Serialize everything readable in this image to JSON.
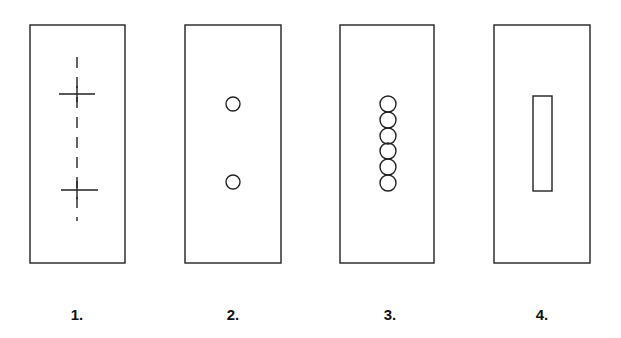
{
  "figure": {
    "stroke_color": "#222222",
    "background": "#ffffff",
    "panels": [
      {
        "label": "1.",
        "frame": {
          "x": 30,
          "y": 25,
          "w": 95,
          "h": 238
        },
        "content": "dashed vertical center line with two cross marks",
        "crosses_y": [
          94,
          189
        ],
        "center_x": 77
      },
      {
        "label": "2.",
        "frame": {
          "x": 185,
          "y": 25,
          "w": 96,
          "h": 238
        },
        "content": "two small circles on vertical center line",
        "circles": [
          {
            "cx": 233,
            "cy": 104,
            "r": 7
          },
          {
            "cx": 233,
            "cy": 182,
            "r": 7
          }
        ]
      },
      {
        "label": "3.",
        "frame": {
          "x": 340,
          "y": 25,
          "w": 94,
          "h": 238
        },
        "content": "vertical chain of six overlapping circles",
        "circle_count": 6,
        "circles_cx": 388,
        "circles_start_cy": 104,
        "circles_spacing": 15.8,
        "circle_r": 8
      },
      {
        "label": "4.",
        "frame": {
          "x": 494,
          "y": 25,
          "w": 96,
          "h": 238
        },
        "content": "narrow vertical rectangular slot",
        "slot": {
          "x": 533,
          "y": 96,
          "w": 19,
          "h": 95
        }
      }
    ]
  }
}
